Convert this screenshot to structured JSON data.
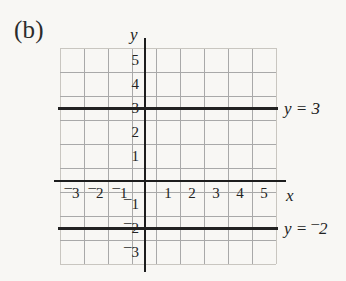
{
  "figure": {
    "panel_label": "(b)",
    "x_axis_name": "x",
    "y_axis_name": "y"
  },
  "labels": {
    "line_top": {
      "lhs": "y",
      "eq": "=",
      "rhs": "3",
      "negative": false
    },
    "line_bottom": {
      "lhs": "y",
      "eq": "=",
      "rhs": "2",
      "negative": true
    }
  },
  "ticks": {
    "x": [
      {
        "text": "3",
        "negative": true,
        "value": -3
      },
      {
        "text": "2",
        "negative": true,
        "value": -2
      },
      {
        "text": "1",
        "negative": true,
        "value": -1
      },
      {
        "text": "1",
        "negative": false,
        "value": 1
      },
      {
        "text": "2",
        "negative": false,
        "value": 2
      },
      {
        "text": "3",
        "negative": false,
        "value": 3
      },
      {
        "text": "4",
        "negative": false,
        "value": 4
      },
      {
        "text": "5",
        "negative": false,
        "value": 5
      }
    ],
    "y": [
      {
        "text": "5",
        "negative": false,
        "value": 5
      },
      {
        "text": "4",
        "negative": false,
        "value": 4
      },
      {
        "text": "3",
        "negative": false,
        "value": 3
      },
      {
        "text": "2",
        "negative": false,
        "value": 2
      },
      {
        "text": "1",
        "negative": false,
        "value": 1
      },
      {
        "text": "1",
        "negative": true,
        "value": -1
      },
      {
        "text": "2",
        "negative": true,
        "value": -2
      },
      {
        "text": "3",
        "negative": true,
        "value": -3
      }
    ]
  },
  "colors": {
    "background": "#f8f7f4",
    "grid": "#a9a9a9",
    "axis": "#1d1d1d",
    "line": "#222222",
    "text": "#232323"
  },
  "chart_data": {
    "type": "line",
    "title": "(b)",
    "xlabel": "x",
    "ylabel": "y",
    "xlim": [
      -3.5,
      5.5
    ],
    "ylim": [
      -3.5,
      5.5
    ],
    "xticks": [
      -3,
      -2,
      -1,
      1,
      2,
      3,
      4,
      5
    ],
    "yticks": [
      5,
      4,
      3,
      2,
      1,
      -1,
      -2,
      -3
    ],
    "grid": true,
    "grid_spacing": 1,
    "legend": "none",
    "series": [
      {
        "name": "y = 3",
        "equation": "y = 3",
        "constant_y": 3,
        "x": [
          -3.5,
          5.5
        ],
        "values": [
          3,
          3
        ],
        "annotation": "y = 3",
        "annotation_x": 5.6,
        "annotation_y": 3
      },
      {
        "name": "y = -2",
        "equation": "y = ⁻2",
        "constant_y": -2,
        "x": [
          -3.5,
          5.5
        ],
        "values": [
          -2,
          -2
        ],
        "annotation": "y = ⁻2",
        "annotation_x": 5.6,
        "annotation_y": -2
      }
    ]
  }
}
